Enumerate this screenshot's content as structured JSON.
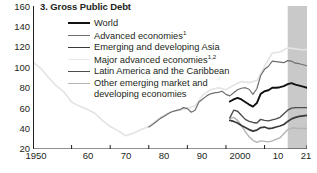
{
  "chart_data": {
    "type": "line",
    "title": "3. Gross Public Debt",
    "xlabel": "",
    "ylabel": "",
    "xlim": [
      1950,
      2021
    ],
    "ylim": [
      20,
      160
    ],
    "ytick_values": [
      20,
      40,
      60,
      80,
      100,
      120,
      140,
      160
    ],
    "ytick_labels": [
      "20",
      "40",
      "60",
      "80",
      "100",
      "120",
      "140",
      "160"
    ],
    "yminor_step": 10,
    "xtick_values": [
      1950,
      1960,
      1970,
      1980,
      1990,
      2000,
      2010,
      2021
    ],
    "xtick_labels": [
      "1950",
      "60",
      "70",
      "80",
      "90",
      "2000",
      "10",
      "21"
    ],
    "grid": false,
    "legend_position": "top-center",
    "forecast_shading": {
      "from": 2016,
      "to": 2021,
      "color": "#c9c9c9"
    },
    "series": [
      {
        "name": "World",
        "color": "#111111",
        "width": 1.9,
        "x": [
          2001,
          2002,
          2003,
          2004,
          2005,
          2006,
          2007,
          2008,
          2009,
          2010,
          2011,
          2012,
          2013,
          2014,
          2015,
          2016,
          2017,
          2018,
          2019,
          2020,
          2021
        ],
        "values": [
          66.5,
          68.5,
          70.0,
          68.5,
          66.0,
          63.5,
          61.5,
          65.0,
          74.0,
          76.5,
          77.5,
          80.0,
          80.0,
          80.5,
          81.5,
          83.5,
          84.5,
          83.0,
          82.0,
          81.0,
          80.0
        ]
      },
      {
        "name": "Advanced economies",
        "footnote": "1",
        "color": "#6f6f6f",
        "width": 1.2,
        "x": [
          1980,
          1981,
          1982,
          1983,
          1984,
          1985,
          1986,
          1987,
          1988,
          1989,
          1990,
          1991,
          1992,
          1993,
          1994,
          1995,
          1996,
          1997,
          1998,
          1999,
          2000,
          2001,
          2002,
          2003,
          2004,
          2005,
          2006,
          2007,
          2008,
          2009,
          2010,
          2011,
          2012,
          2013,
          2014,
          2015,
          2016,
          2017,
          2018,
          2019,
          2020,
          2021
        ],
        "values": [
          41.5,
          44.0,
          47.0,
          50.0,
          52.0,
          54.5,
          56.5,
          57.5,
          58.5,
          60.5,
          59.5,
          56.0,
          58.0,
          66.0,
          69.0,
          72.0,
          74.0,
          75.0,
          75.5,
          76.5,
          73.5,
          72.0,
          75.0,
          78.0,
          79.5,
          80.0,
          78.5,
          73.5,
          79.0,
          92.0,
          98.0,
          101.0,
          106.0,
          105.5,
          105.0,
          104.5,
          106.5,
          106.0,
          104.0,
          103.5,
          102.5,
          101.5
        ]
      },
      {
        "name": "Emerging and developing Asia",
        "color": "#3a3a3a",
        "width": 1.7,
        "x": [
          2001,
          2002,
          2003,
          2004,
          2005,
          2006,
          2007,
          2008,
          2009,
          2010,
          2011,
          2012,
          2013,
          2014,
          2015,
          2016,
          2017,
          2018,
          2019,
          2020,
          2021
        ],
        "values": [
          48.0,
          47.0,
          45.5,
          43.0,
          41.0,
          39.0,
          37.5,
          38.5,
          41.0,
          41.5,
          40.0,
          40.5,
          41.5,
          42.5,
          44.0,
          47.0,
          49.5,
          51.0,
          52.0,
          52.5,
          53.0
        ]
      },
      {
        "name": "Major advanced economies",
        "footnote": "1,2",
        "color": "#e3e3e3",
        "width": 1.6,
        "x": [
          1950,
          1952,
          1954,
          1956,
          1958,
          1960,
          1962,
          1964,
          1966,
          1968,
          1970,
          1972,
          1974,
          1976,
          1978,
          1980,
          1982,
          1984,
          1986,
          1988,
          1990,
          1992,
          1994,
          1996,
          1998,
          2000,
          2002,
          2004,
          2006,
          2008,
          2010,
          2012,
          2014,
          2016,
          2018,
          2020,
          2021
        ],
        "values": [
          105.0,
          99.0,
          90.0,
          82.0,
          76.0,
          66.0,
          62.0,
          59.0,
          55.0,
          48.0,
          42.0,
          38.0,
          33.0,
          35.5,
          39.0,
          42.0,
          48.0,
          53.0,
          57.0,
          58.0,
          60.0,
          62.0,
          73.0,
          78.0,
          80.0,
          78.0,
          82.5,
          86.0,
          85.0,
          87.0,
          101.0,
          114.0,
          115.0,
          119.0,
          118.0,
          117.0,
          117.5
        ]
      },
      {
        "name": "Latin America and the Caribbean",
        "color": "#4d4d4d",
        "width": 1.4,
        "x": [
          2001,
          2002,
          2003,
          2004,
          2005,
          2006,
          2007,
          2008,
          2009,
          2010,
          2011,
          2012,
          2013,
          2014,
          2015,
          2016,
          2017,
          2018,
          2019,
          2020,
          2021
        ],
        "values": [
          50.5,
          58.0,
          57.0,
          53.0,
          49.0,
          47.0,
          46.0,
          45.5,
          49.0,
          48.0,
          47.5,
          48.5,
          49.5,
          51.0,
          54.5,
          58.0,
          60.0,
          60.5,
          60.5,
          60.5,
          60.5
        ]
      },
      {
        "name": "Other emerging market and developing economies",
        "color": "#b4b4b4",
        "width": 1.4,
        "x": [
          2001,
          2002,
          2003,
          2004,
          2005,
          2006,
          2007,
          2008,
          2009,
          2010,
          2011,
          2012,
          2013,
          2014,
          2015,
          2016,
          2017,
          2018,
          2019,
          2020,
          2021
        ],
        "values": [
          49.5,
          51.0,
          48.0,
          43.0,
          37.0,
          32.0,
          28.5,
          26.5,
          28.0,
          27.5,
          27.0,
          28.0,
          29.5,
          31.0,
          35.0,
          39.0,
          40.5,
          40.5,
          40.0,
          40.0,
          40.0
        ]
      }
    ]
  },
  "legend": {
    "items": [
      {
        "label": "World",
        "sup": ""
      },
      {
        "label": "Advanced economies",
        "sup": "1"
      },
      {
        "label": "Emerging and developing Asia",
        "sup": ""
      },
      {
        "label": "Major advanced economies",
        "sup": "1,2"
      },
      {
        "label": "Latin America and the Caribbean",
        "sup": ""
      },
      {
        "label": "Other emerging market and",
        "sup": ""
      }
    ],
    "continuation": "developing economies"
  }
}
